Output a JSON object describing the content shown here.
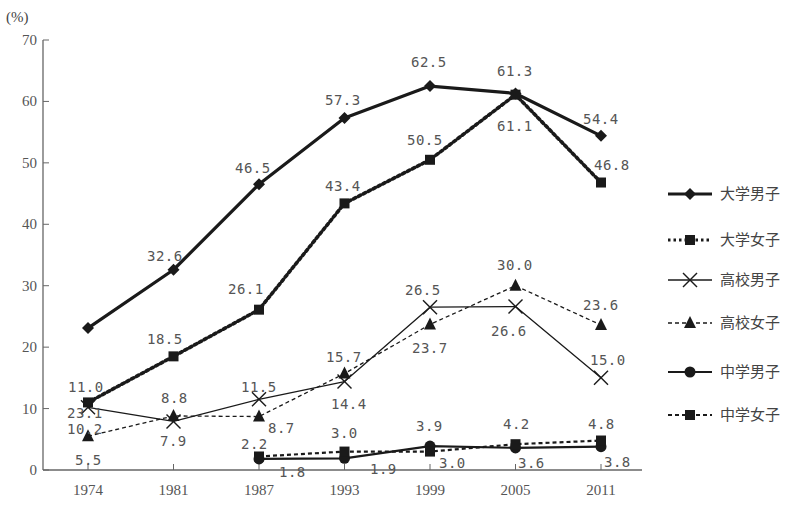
{
  "chart_data": {
    "type": "line",
    "title": "",
    "ylabel": "(%)",
    "xlabel": "",
    "ylim": [
      0,
      70
    ],
    "yticks": [
      0,
      10,
      20,
      30,
      40,
      50,
      60,
      70
    ],
    "categories": [
      "1974",
      "1981",
      "1987",
      "1993",
      "1999",
      "2005",
      "2011"
    ],
    "grid": false,
    "legend_position": "right",
    "series": [
      {
        "name": "大学男子",
        "style": "solid-thick",
        "marker": "diamond",
        "values": [
          23.1,
          32.6,
          46.5,
          57.3,
          62.5,
          61.3,
          54.4
        ]
      },
      {
        "name": "大学女子",
        "style": "dotted-thick",
        "marker": "square",
        "values": [
          11.0,
          18.5,
          26.1,
          43.4,
          50.5,
          61.1,
          46.8
        ]
      },
      {
        "name": "高校男子",
        "style": "solid-thin",
        "marker": "x",
        "values": [
          10.2,
          7.9,
          11.5,
          14.4,
          26.5,
          26.6,
          15.0
        ]
      },
      {
        "name": "高校女子",
        "style": "dashed-thin",
        "marker": "triangle",
        "values": [
          5.5,
          8.8,
          8.7,
          15.7,
          23.7,
          30.0,
          23.6
        ]
      },
      {
        "name": "中学男子",
        "style": "solid-medium",
        "marker": "circle",
        "values": [
          null,
          null,
          1.8,
          1.9,
          3.9,
          3.6,
          3.8
        ]
      },
      {
        "name": "中学女子",
        "style": "dashed-medium",
        "marker": "square",
        "values": [
          null,
          null,
          2.2,
          3.0,
          3.0,
          4.2,
          4.8
        ]
      }
    ],
    "data_labels": [
      {
        "text": "23.1",
        "x": 67,
        "y": 418
      },
      {
        "text": "32.6",
        "x": 147,
        "y": 261
      },
      {
        "text": "46.5",
        "x": 235,
        "y": 173
      },
      {
        "text": "57.3",
        "x": 325,
        "y": 105
      },
      {
        "text": "62.5",
        "x": 411,
        "y": 67
      },
      {
        "text": "61.3",
        "x": 497,
        "y": 76
      },
      {
        "text": "54.4",
        "x": 583,
        "y": 124
      },
      {
        "text": "18.5",
        "x": 147,
        "y": 344
      },
      {
        "text": "26.1",
        "x": 228,
        "y": 294
      },
      {
        "text": "43.4",
        "x": 325,
        "y": 191
      },
      {
        "text": "50.5",
        "x": 407,
        "y": 145
      },
      {
        "text": "61.1",
        "x": 497,
        "y": 131
      },
      {
        "text": "46.8",
        "x": 594,
        "y": 170
      },
      {
        "text": "11.0",
        "x": 68,
        "y": 392
      },
      {
        "text": "10.2",
        "x": 67,
        "y": 434
      },
      {
        "text": "5.5",
        "x": 75,
        "y": 465
      },
      {
        "text": "8.8",
        "x": 161,
        "y": 403
      },
      {
        "text": "7.9",
        "x": 160,
        "y": 446
      },
      {
        "text": "11.5",
        "x": 241,
        "y": 392
      },
      {
        "text": "8.7",
        "x": 268,
        "y": 433
      },
      {
        "text": "15.7",
        "x": 326,
        "y": 362
      },
      {
        "text": "14.4",
        "x": 331,
        "y": 409
      },
      {
        "text": "26.5",
        "x": 405,
        "y": 295
      },
      {
        "text": "23.7",
        "x": 412,
        "y": 353
      },
      {
        "text": "30.0",
        "x": 497,
        "y": 270
      },
      {
        "text": "26.6",
        "x": 491,
        "y": 336
      },
      {
        "text": "23.6",
        "x": 583,
        "y": 310
      },
      {
        "text": "15.0",
        "x": 590,
        "y": 365
      },
      {
        "text": "2.2",
        "x": 241,
        "y": 449
      },
      {
        "text": "1.8",
        "x": 279,
        "y": 477
      },
      {
        "text": "3.0",
        "x": 331,
        "y": 438
      },
      {
        "text": "1.9",
        "x": 370,
        "y": 474
      },
      {
        "text": "3.9",
        "x": 416,
        "y": 431
      },
      {
        "text": "3.0",
        "x": 439,
        "y": 468
      },
      {
        "text": "4.2",
        "x": 503,
        "y": 429
      },
      {
        "text": "3.6",
        "x": 518,
        "y": 468
      },
      {
        "text": "4.8",
        "x": 588,
        "y": 429
      },
      {
        "text": "3.8",
        "x": 604,
        "y": 467
      }
    ]
  },
  "axis": {
    "unit_label": "(%)"
  },
  "colors": {
    "line": "#1a1a1a",
    "axis": "#666666",
    "text": "#555555"
  }
}
